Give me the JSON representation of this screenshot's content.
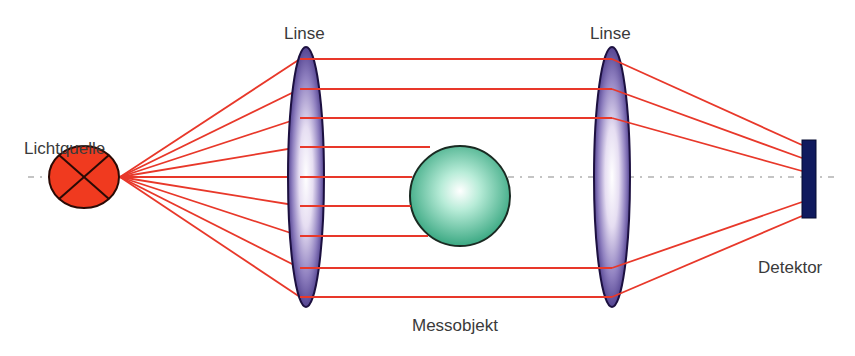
{
  "labels": {
    "light_source": "Lichtquelle",
    "lens_left": "Linse",
    "lens_right": "Linse",
    "object": "Messobjekt",
    "detector": "Detektor"
  },
  "colors": {
    "ray": "#e8382a",
    "source_fill": "#f03a1f",
    "lens_edge": "#2a1a5a",
    "lens_dark": "#4a3a8e",
    "object_fill": "#3fb38a",
    "detector_fill": "#101a5e",
    "axis": "#8a8a8a"
  }
}
